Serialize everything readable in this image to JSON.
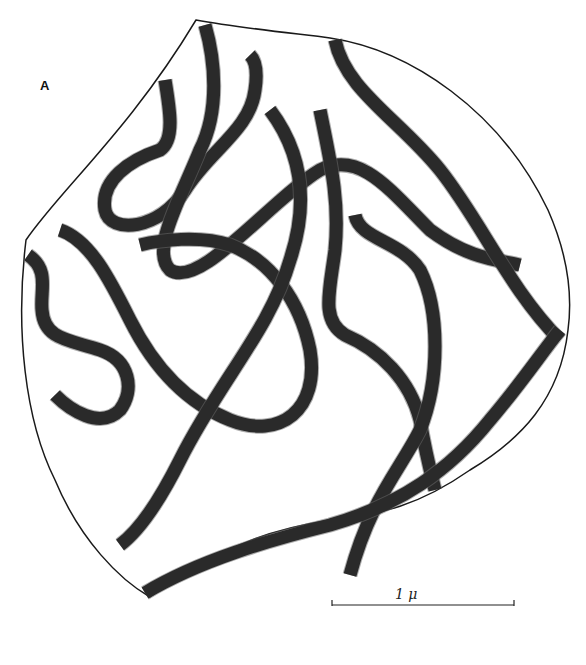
{
  "figure": {
    "panel_label": "A",
    "scale_bar": {
      "label": "1 μ",
      "unit": "micrometer",
      "x_start": 332,
      "x_end": 514,
      "y": 605
    },
    "colors": {
      "background": "#ffffff",
      "strand": "#2a2a2a",
      "outline": "#1a1a1a"
    },
    "content": "Line drawing of tangled chromosome strands enclosed in an irregular rounded nuclear outline"
  }
}
